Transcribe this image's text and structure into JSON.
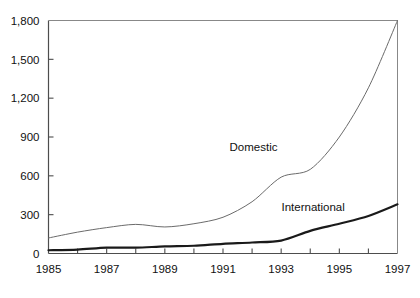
{
  "chart_data": {
    "type": "line",
    "title": "",
    "subtitle": "",
    "xlabel": "",
    "ylabel": "",
    "x": [
      1985,
      1986,
      1987,
      1988,
      1989,
      1990,
      1991,
      1992,
      1993,
      1994,
      1995,
      1996,
      1997
    ],
    "xlim": [
      1985,
      1997
    ],
    "ylim": [
      0,
      1800
    ],
    "yticks": [
      0,
      300,
      600,
      900,
      1200,
      1500,
      1800
    ],
    "ytick_labels": [
      "0",
      "300",
      "600",
      "900",
      "1,200",
      "1,500",
      "1,800"
    ],
    "xticks": [
      1985,
      1986,
      1987,
      1988,
      1989,
      1990,
      1991,
      1992,
      1993,
      1994,
      1995,
      1996,
      1997
    ],
    "xtick_labels": [
      "1985",
      "",
      "1987",
      "",
      "1989",
      "",
      "1991",
      "",
      "1993",
      "",
      "1995",
      "",
      "1997"
    ],
    "xtick_labels_shown": [
      "1985",
      "1987",
      "1989",
      "1991",
      "1993",
      "1995",
      "1997"
    ],
    "grid": false,
    "legend": "inline-annotations",
    "legend_position": "inline",
    "series": [
      {
        "name": "Domestic",
        "color": "#6b6b6b",
        "line_width": 1.0,
        "values": [
          120,
          165,
          200,
          225,
          205,
          230,
          280,
          400,
          590,
          650,
          900,
          1280,
          1800
        ]
      },
      {
        "name": "International",
        "color": "#1a1a1a",
        "line_width": 2.2,
        "values": [
          25,
          30,
          45,
          45,
          55,
          60,
          75,
          85,
          100,
          175,
          230,
          290,
          380
        ]
      }
    ],
    "annotations": [
      {
        "text": "Domestic",
        "x": 1992.05,
        "y": 790
      },
      {
        "text": "International",
        "x": 1994.1,
        "y": 330
      }
    ]
  },
  "colors": {
    "background": "#ffffff",
    "axis": "#4d4d4d",
    "text": "#111111",
    "domestic_line": "#6b6b6b",
    "international_line": "#1a1a1a"
  }
}
